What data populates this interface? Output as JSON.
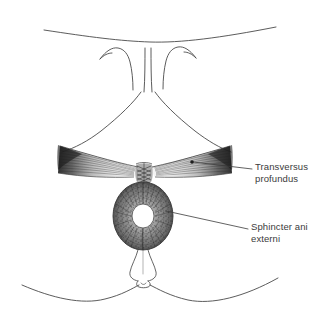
{
  "figure": {
    "background_color": "#ffffff",
    "ink_color": "#3b3b3b",
    "muscle_shade_color": "#4a4a4a",
    "width": 332,
    "height": 332
  },
  "labels": [
    {
      "id": "transversus",
      "name": "transversus-profundus-label",
      "line1": "Transversus",
      "line2": "profundus",
      "x": 255,
      "y": 161,
      "leader": {
        "marker": "dot",
        "dot_x": 192,
        "dot_y": 162,
        "to_x": 252,
        "to_y": 169
      }
    },
    {
      "id": "sphincter",
      "name": "sphincter-ani-externi-label",
      "line1": "Sphincter ani",
      "line2": "externi",
      "x": 251,
      "y": 221,
      "leader": {
        "marker": "line",
        "dot_x": 168,
        "dot_y": 211,
        "to_x": 248,
        "to_y": 229
      }
    }
  ],
  "structures": [
    {
      "id": "transversus-profundus",
      "name": "transversus-profundus-muscle",
      "description": "Paired triangular muscle wings converging at the perineal body",
      "shade": "#4a4a4a"
    },
    {
      "id": "sphincter-ani-externi",
      "name": "sphincter-ani-externi-muscle",
      "description": "Oval ring of circumferential muscle fibers surrounding the anal canal",
      "shade": "#555555"
    },
    {
      "id": "anal-canal",
      "name": "anal-canal-lumen",
      "description": "Central white opening",
      "shade": "#ffffff"
    },
    {
      "id": "perineal-body",
      "name": "perineal-body",
      "description": "Dark cross-hatched tendinous centre between the transversus and the sphincter",
      "shade": "#2e2e2e"
    },
    {
      "id": "anococcygeal-body",
      "name": "anococcygeal-body",
      "description": "Small flask-shaped raphe below the sphincter",
      "shade": "#3b3b3b"
    },
    {
      "id": "vulval-folds",
      "name": "vulval-fold-outline",
      "description": "Paired vertical folds above the perineum",
      "shade": "#3b3b3b"
    },
    {
      "id": "thigh-contour-upper",
      "name": "upper-body-contour",
      "description": "Broad shallow curve across the top of the figure",
      "shade": "#3b3b3b"
    },
    {
      "id": "gluteal-contour-lower",
      "name": "lower-gluteal-contour",
      "description": "Gentle W-shaped curve across the bottom of the figure",
      "shade": "#3b3b3b"
    }
  ]
}
